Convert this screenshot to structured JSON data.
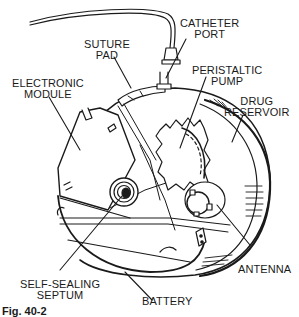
{
  "figure": {
    "caption": "Fig. 40-2",
    "line_color": "#1a1a1a",
    "background": "#ffffff",
    "labels": {
      "catheter_port": "CATHETER\nPORT",
      "suture_pad": "SUTURE\nPAD",
      "peristaltic_pump": "PERISTALTIC\nPUMP",
      "electronic_module": "ELECTRONIC\nMODULE",
      "drug_reservoir": "DRUG\nRESERVOIR",
      "antenna": "ANTENNA",
      "self_sealing_septum": "SELF-SEALING\nSEPTUM",
      "battery": "BATTERY"
    }
  }
}
